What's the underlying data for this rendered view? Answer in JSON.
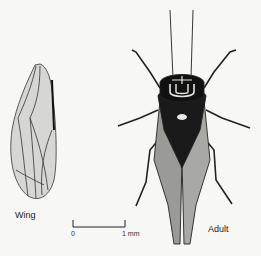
{
  "figure": {
    "labels": {
      "wing": "Wing",
      "adult": "Adult"
    },
    "scale_bar": {
      "start": "0",
      "end": "1 mm"
    }
  }
}
